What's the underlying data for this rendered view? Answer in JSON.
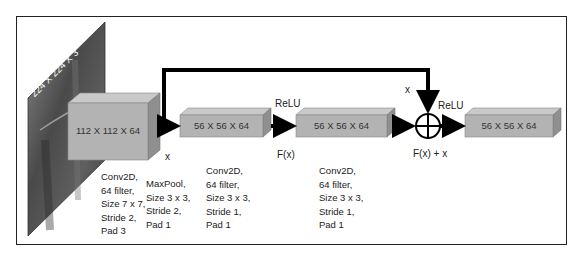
{
  "input": {
    "label": "224 X 224 X 3"
  },
  "blocks": [
    {
      "label": "112 X 112 X 64"
    },
    {
      "label": "56 X 56 X 64"
    },
    {
      "label": "56 X 56 X 64"
    },
    {
      "label": "56 X 56 X 64"
    }
  ],
  "annotations": {
    "x_after_first": "x",
    "x_skip": "x",
    "relu_1": "ReLU",
    "relu_2": "ReLU",
    "fx": "F(x)",
    "fx_plus_x": "F(x) + x"
  },
  "layer_params": [
    {
      "lines": [
        "Conv2D,",
        "64 filter,",
        "Size 7 x 7,",
        "Stride 2,",
        "Pad 3"
      ]
    },
    {
      "lines": [
        "MaxPool,",
        "Size 3 x 3,",
        "Stride 2,",
        "Pad 1"
      ]
    },
    {
      "lines": [
        "Conv2D,",
        "64 filter,",
        "Size 3 x 3,",
        "Stride 1,",
        "Pad 1"
      ]
    },
    {
      "lines": [
        "Conv2D,",
        "64 filter,",
        "Size 3 x 3,",
        "Stride 1,",
        "Pad 1"
      ]
    }
  ],
  "colors": {
    "box_front": "#b3b3b3",
    "box_top": "#c9c9c9",
    "box_side": "#8f8f8f",
    "arrow": "#000000",
    "image_plane": "#555555"
  }
}
